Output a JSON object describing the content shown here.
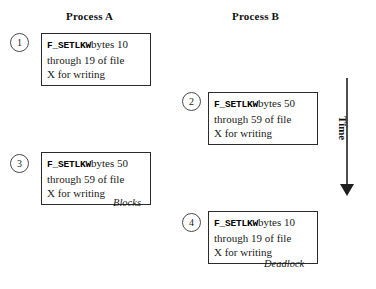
{
  "diagram": {
    "headers": {
      "process_a": "Process A",
      "process_b": "Process B"
    },
    "time_axis": {
      "label": "Time",
      "direction": "down"
    },
    "steps": [
      {
        "number": "1",
        "column": "Process A",
        "function": "F_SETLKW",
        "line1_rest": "bytes 10",
        "line2": "through 19 of file",
        "line3": "X for writing"
      },
      {
        "number": "2",
        "column": "Process B",
        "function": "F_SETLKW",
        "line1_rest": "bytes 50",
        "line2": "through 59 of file",
        "line3": "X for writing"
      },
      {
        "number": "3",
        "column": "Process A",
        "function": "F_SETLKW",
        "line1_rest": "bytes 50",
        "line2": "through 59 of file",
        "line3": "X for writing"
      },
      {
        "number": "4",
        "column": "Process B",
        "function": "F_SETLKW",
        "line1_rest": "bytes 10",
        "line2": "through 19 of file",
        "line3": "X for writing"
      }
    ],
    "annotations": {
      "blocks": "Blocks",
      "deadlock": "Deadlock"
    },
    "colors": {
      "background": "#ffffff",
      "box_border": "#2b2b2b",
      "circle_border": "#4a4a4a",
      "text": "#1a1a1a",
      "arrow": "#1f1f1f"
    }
  }
}
